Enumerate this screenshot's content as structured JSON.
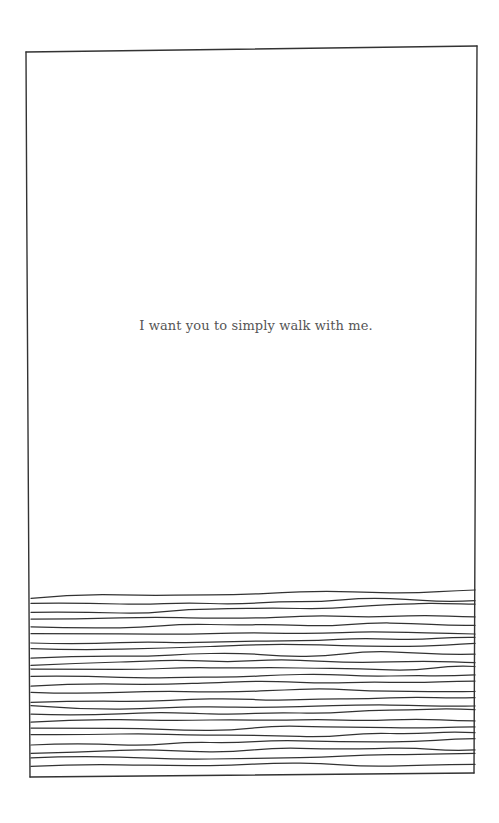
{
  "page": {
    "caption": "I want you to simply walk with me."
  },
  "illustration": {
    "frame": {
      "top_left": [
        26,
        52
      ],
      "top_right": [
        477,
        46
      ],
      "bottom_right": [
        474,
        773
      ],
      "bottom_left": [
        30,
        777
      ]
    },
    "stroke_color": "#333333",
    "line_count": 24,
    "lines_start_y": 598,
    "lines_spacing": 7.3
  }
}
